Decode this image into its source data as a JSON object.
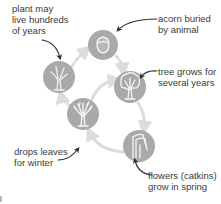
{
  "colors": {
    "stage_fill": "#a9a9a9",
    "icon_stroke": "#f4f4f4",
    "cycle_arrow": "#dcdcdc",
    "label_arrow": "#333333",
    "text": "#3a3a3a"
  },
  "stages": [
    {
      "id": "acorn",
      "icon": "acorn-icon",
      "label_lines": [
        "acorn buried",
        "by animal"
      ]
    },
    {
      "id": "young-tree",
      "icon": "leafy-tree-icon",
      "label_lines": [
        "tree grows for",
        "several years"
      ]
    },
    {
      "id": "catkins",
      "icon": "catkin-flower-icon",
      "label_lines": [
        "flowers (catkins)",
        "grow in spring"
      ]
    },
    {
      "id": "winter-tree",
      "icon": "bare-tree-icon",
      "label_lines": [
        "drops leaves",
        "for winter"
      ]
    },
    {
      "id": "old-tree",
      "icon": "old-tree-icon",
      "label_lines": [
        "plant may",
        "live hundreds",
        "of years"
      ]
    }
  ]
}
